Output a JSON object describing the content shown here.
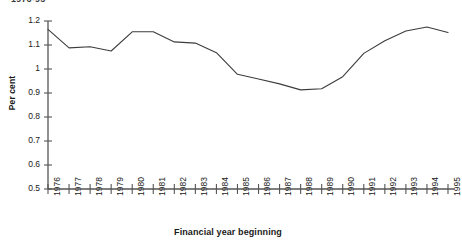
{
  "clipped_title": "1976-95",
  "chart_data": {
    "type": "line",
    "title": "1976-95",
    "xlabel": "Financial year beginning",
    "ylabel": "Per cent",
    "x": [
      1976,
      1977,
      1978,
      1979,
      1980,
      1981,
      1982,
      1983,
      1984,
      1985,
      1986,
      1987,
      1988,
      1989,
      1990,
      1991,
      1992,
      1993,
      1994,
      1995
    ],
    "categories": [
      "1976",
      "1977",
      "1978",
      "1979",
      "1980",
      "1981",
      "1982",
      "1983",
      "1984",
      "1985",
      "1986",
      "1987",
      "1988",
      "1989",
      "1990",
      "1991",
      "1992",
      "1993",
      "1994",
      "1995"
    ],
    "values": [
      1.165,
      1.088,
      1.093,
      1.075,
      1.155,
      1.155,
      1.113,
      1.108,
      1.068,
      0.978,
      0.958,
      0.938,
      0.913,
      0.918,
      0.968,
      1.065,
      1.118,
      1.158,
      1.175,
      1.152
    ],
    "series": [
      {
        "name": "Per cent",
        "values": [
          1.165,
          1.088,
          1.093,
          1.075,
          1.155,
          1.155,
          1.113,
          1.108,
          1.068,
          0.978,
          0.958,
          0.938,
          0.913,
          0.918,
          0.968,
          1.065,
          1.118,
          1.158,
          1.175,
          1.152
        ]
      }
    ],
    "ylim": [
      0.5,
      1.2
    ],
    "yticks": [
      0.5,
      0.6,
      0.7,
      0.8,
      0.9,
      1.0,
      1.1,
      1.2
    ],
    "ytick_labels": [
      "0.5",
      "0.6",
      "0.7",
      "0.8",
      "0.9",
      "1",
      "1.1",
      "1.2"
    ],
    "grid": false,
    "legend": "none",
    "line_color": "#3c3c3c",
    "axis_color": "#555555"
  }
}
